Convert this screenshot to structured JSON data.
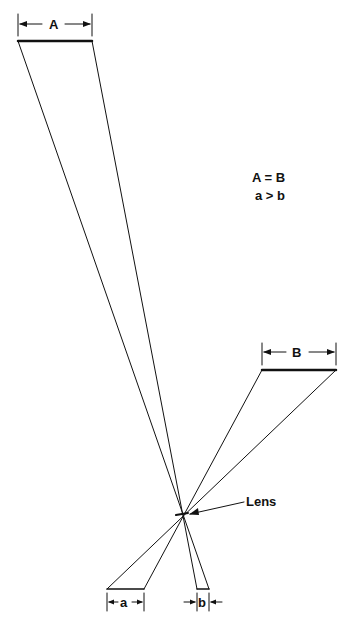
{
  "header": {
    "text": ""
  },
  "diagram": {
    "labels": {
      "top_object": "A",
      "right_object": "B",
      "image_a": "a",
      "image_b": "b",
      "lens": "Lens"
    },
    "relations": {
      "line1": "A = B",
      "line2": "a > b"
    },
    "geometry": {
      "lens_center": [
        182,
        514
      ],
      "object_A": {
        "x1": 18,
        "x2": 92,
        "y": 41
      },
      "object_B": {
        "x1": 262,
        "x2": 336,
        "y": 370
      },
      "image_a": {
        "x1": 107,
        "x2": 144,
        "y": 589
      },
      "image_b": {
        "x1": 197,
        "x2": 209,
        "y": 589
      }
    }
  }
}
